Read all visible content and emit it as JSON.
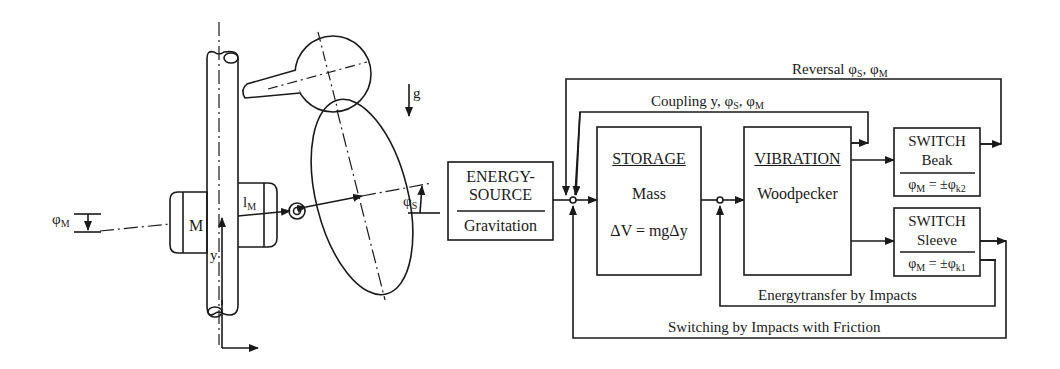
{
  "mechanism": {
    "labels": {
      "phi_m": "φ",
      "phi_m_sub": "M",
      "mass": "M",
      "l_m": "l",
      "l_m_sub": "M",
      "y": "y",
      "g": "g",
      "phi_s": "φ",
      "phi_s_sub": "S"
    }
  },
  "blocks": {
    "energy_source": {
      "title_line1": "ENERGY-",
      "title_line2": "SOURCE",
      "subtitle": "Gravitation"
    },
    "storage": {
      "title": "STORAGE",
      "line1": "Mass",
      "line2": "ΔV = mgΔy"
    },
    "vibration": {
      "title": "VIBRATION",
      "line1": "Woodpecker"
    },
    "switch_beak": {
      "title": "SWITCH",
      "name": "Beak",
      "eq_left": "φ",
      "eq_left_sub": "M",
      "eq_mid": " = ±φ",
      "eq_right_sub": "k2"
    },
    "switch_sleeve": {
      "title": "SWITCH",
      "name": "Sleeve",
      "eq_left": "φ",
      "eq_left_sub": "M",
      "eq_mid": " = ±φ",
      "eq_right_sub": "k1"
    }
  },
  "feedback": {
    "reversal": {
      "text": "Reversal φ",
      "s1": "S",
      "sep": ", φ",
      "s2": "M"
    },
    "coupling": {
      "text": "Coupling y, φ",
      "s1": "S",
      "sep": ", φ",
      "s2": "M"
    },
    "energy_transfer": "Energytransfer by Impacts",
    "switching": "Switching by Impacts with Friction"
  },
  "colors": {
    "ink": "#1a1a1a",
    "background": "#ffffff"
  }
}
